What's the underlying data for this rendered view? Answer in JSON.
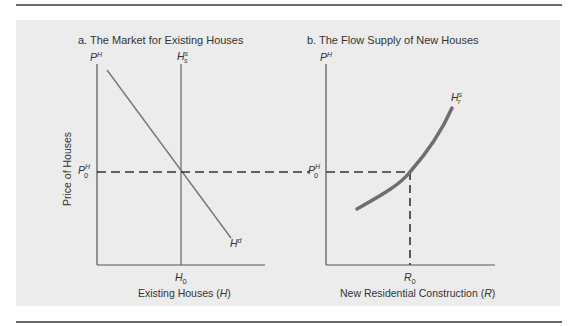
{
  "figure": {
    "panel_a": {
      "title": "a.  The Market for Existing Houses",
      "y_axis_symbol": "P",
      "y_axis_symbol_sup": "H",
      "y_axis_label": "Price of Houses",
      "price_marker": "P",
      "price_marker_sup": "H",
      "price_marker_sub": "0",
      "supply_label": "H",
      "supply_label_sup": "s",
      "supply_label_sub": "s",
      "demand_label": "H",
      "demand_label_sup": "d",
      "x_marker": "H",
      "x_marker_sub": "0",
      "x_axis_label_pre": "Existing Houses (",
      "x_axis_label_var": "H",
      "x_axis_label_post": ")"
    },
    "panel_b": {
      "title": "b.  The Flow Supply of New Houses",
      "y_axis_symbol": "P",
      "y_axis_symbol_sup": "H",
      "price_marker": "P",
      "price_marker_sup": "H",
      "price_marker_sub": "0",
      "supply_label": "H",
      "supply_label_sup": "s",
      "supply_label_sub": "r",
      "x_marker": "R",
      "x_marker_sub": "0",
      "x_axis_label_pre": "New Residential Construction (",
      "x_axis_label_var": "R",
      "x_axis_label_post": ")"
    },
    "colors": {
      "panel_bg": "#ececec",
      "rule": "#6a6a6a",
      "axis": "#555555",
      "demand_line": "#777777",
      "supply_curve": "#6e6e6e",
      "dashed": "#333333"
    }
  }
}
